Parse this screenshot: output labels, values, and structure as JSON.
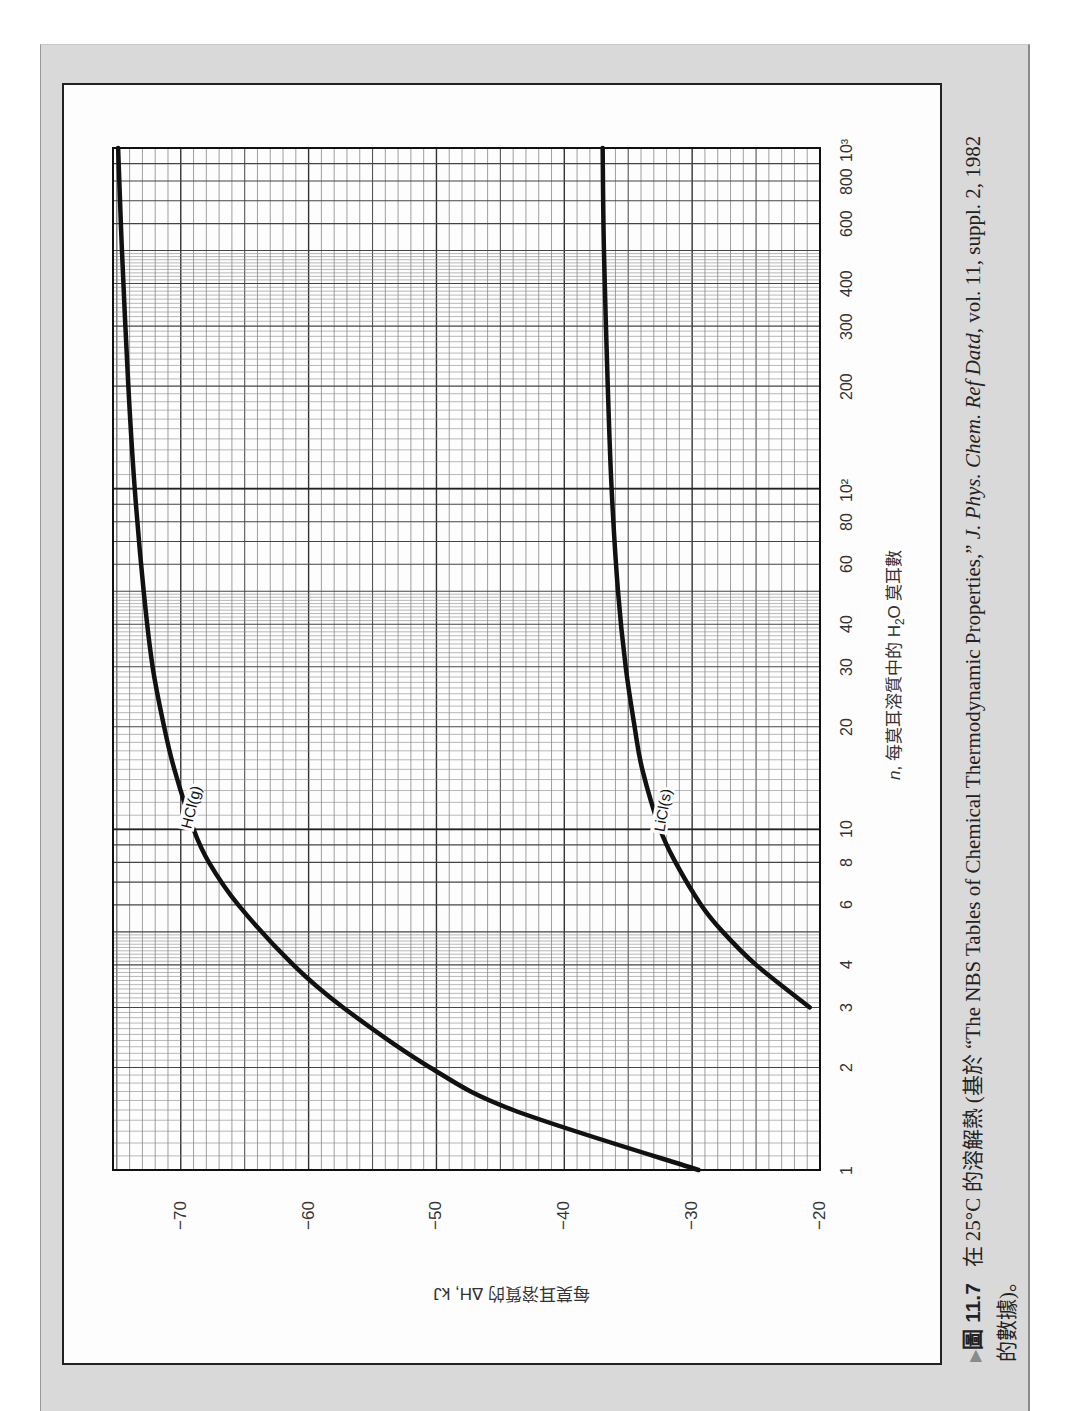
{
  "figure": {
    "number": "圖 11.7",
    "caption_prefix": "在 25°C 的溶解熱 (基於 “The NBS Tables of Chemical Thermodynamic Properties,” ",
    "caption_journal": "J. Phys. Chem. Ref Datd",
    "caption_suffix": ", vol. 11, suppl. 2, 1982",
    "caption_line2": "的數據)。",
    "arrow_icon": "▶"
  },
  "axes": {
    "x_title_var": "n",
    "x_title_text": ", 每莫耳溶質中的 H",
    "x_title_sub": "2",
    "x_title_end": "O 莫耳數",
    "y_title": "每莫耳溶質的 ΔH, kJ"
  },
  "chart_data": {
    "type": "line",
    "xlabel": "ñ, 每莫耳溶質中的 H2O 莫耳數",
    "ylabel": "每莫耳溶質的 ΔH̃, kJ",
    "xscale": "log",
    "xlim": [
      1,
      1000
    ],
    "ylim": [
      -75.3,
      -20
    ],
    "grid": true,
    "x_ticks": [
      {
        "v": 1,
        "label": "1"
      },
      {
        "v": 2,
        "label": "2"
      },
      {
        "v": 3,
        "label": "3"
      },
      {
        "v": 4,
        "label": "4"
      },
      {
        "v": 6,
        "label": "6"
      },
      {
        "v": 8,
        "label": "8"
      },
      {
        "v": 10,
        "label": "10"
      },
      {
        "v": 20,
        "label": "20"
      },
      {
        "v": 30,
        "label": "30"
      },
      {
        "v": 40,
        "label": "40"
      },
      {
        "v": 60,
        "label": "60"
      },
      {
        "v": 80,
        "label": "80"
      },
      {
        "v": 100,
        "label": "10²"
      },
      {
        "v": 200,
        "label": "200"
      },
      {
        "v": 300,
        "label": "300"
      },
      {
        "v": 400,
        "label": "400"
      },
      {
        "v": 600,
        "label": "600"
      },
      {
        "v": 800,
        "label": "800"
      },
      {
        "v": 1000,
        "label": "10³"
      }
    ],
    "y_ticks": [
      -70,
      -60,
      -50,
      -40,
      -30,
      -20
    ],
    "series": [
      {
        "name": "HCl(g)",
        "x": [
          1,
          1.5,
          2,
          3,
          4,
          6,
          8,
          10,
          15,
          20,
          30,
          50,
          100,
          200,
          500,
          1000
        ],
        "y": [
          -29.5,
          -44.0,
          -50.5,
          -57.3,
          -61.2,
          -65.5,
          -67.8,
          -69.0,
          -70.5,
          -71.3,
          -72.2,
          -72.9,
          -73.6,
          -74.1,
          -74.6,
          -74.9
        ]
      },
      {
        "name": "LiCl(s)",
        "x": [
          3,
          4,
          5,
          6,
          8,
          10,
          15,
          20,
          30,
          50,
          100,
          200,
          500,
          1000
        ],
        "y": [
          -20.8,
          -25.0,
          -27.6,
          -29.3,
          -31.3,
          -32.5,
          -33.9,
          -34.5,
          -35.2,
          -35.8,
          -36.3,
          -36.6,
          -36.9,
          -37.0
        ]
      }
    ]
  }
}
